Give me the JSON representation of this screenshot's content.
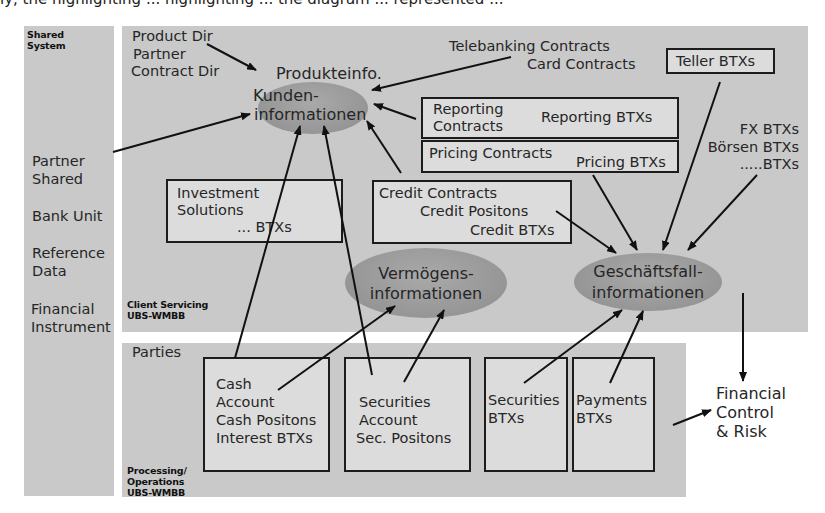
{
  "clipped_caption": "ly, the highlighting ... highlighting ... the diagram ... represented ...",
  "shared_system": {
    "title_line1": "Shared",
    "title_line2": "System",
    "items": [
      "Partner",
      "Shared",
      "Bank Unit",
      "Reference",
      "Data",
      "Financial",
      "Instrument"
    ]
  },
  "client_servicing": {
    "label_line1": "Client Servicing",
    "label_line2": "UBS-WMBB",
    "directories": [
      "Product Dir",
      "Partner",
      "Contract Dir"
    ],
    "contracts_labels": [
      "Telebanking Contracts",
      "Card Contracts"
    ],
    "teller_box": "Teller BTXs",
    "reporting_box": {
      "left_line1": "Reporting",
      "left_line2": "Contracts",
      "right": "Reporting BTXs"
    },
    "pricing_box": {
      "left": "Pricing Contracts",
      "right": "Pricing BTXs"
    },
    "btx_list": [
      "FX BTXs",
      "Börsen BTXs",
      ".....BTXs"
    ],
    "investment_box": {
      "line1": "Investment",
      "line2": "Solutions",
      "line3": "... BTXs"
    },
    "credit_box": {
      "line1": "Credit Contracts",
      "line2": "Credit Positons",
      "line3": "Credit BTXs"
    },
    "ellipses": {
      "kunden": {
        "top": "Produkteinfo.",
        "line1": "Kunden-",
        "line2": "informationen"
      },
      "vermoegen": {
        "line1": "Vermögens-",
        "line2": "informationen"
      },
      "geschaeft": {
        "line1": "Geschäftsfall-",
        "line2": "informationen"
      }
    }
  },
  "processing": {
    "title": "Parties",
    "label_line1": "Processing/",
    "label_line2": "Operations",
    "label_line3": "UBS-WMBB",
    "boxes": [
      {
        "lines": [
          "Cash",
          "Account",
          "Cash Positons",
          "Interest BTXs"
        ]
      },
      {
        "lines": [
          "Securities",
          "Account",
          "Sec. Positons"
        ]
      },
      {
        "lines": [
          "Securities",
          "BTXs"
        ]
      },
      {
        "lines": [
          "Payments",
          "BTXs"
        ]
      }
    ]
  },
  "financial_control": [
    "Financial",
    "Control",
    "& Risk"
  ],
  "colors": {
    "panel": "#c9c9c9",
    "box": "#dcdcdc",
    "ellipse": "#9a9a9a",
    "line": "#111111"
  }
}
